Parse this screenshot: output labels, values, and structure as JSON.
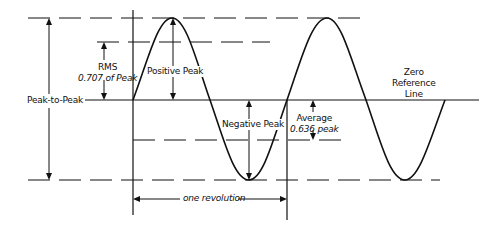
{
  "diagram": {
    "colors": {
      "line": "#111111",
      "background": "#ffffff"
    },
    "labels": {
      "rms_line1": "RMS",
      "rms_line2": "0.707 of Peak",
      "peak_to_peak": "Peak-to-Peak",
      "positive_peak": "Positive Peak",
      "negative_peak": "Negative Peak",
      "average_line1": "Average",
      "average_line2": "0.636 peak",
      "zero_ref_line1": "Zero",
      "zero_ref_line2": "Reference",
      "zero_ref_line3": "Line",
      "one_revolution": "one revolution"
    },
    "levels": {
      "positive_peak_y": 18,
      "rms_y": 42,
      "zero_y": 100,
      "average_y": 140,
      "negative_peak_y": 180
    },
    "wave": {
      "start_x": 133,
      "period_px": 154,
      "cycles": 2
    }
  }
}
